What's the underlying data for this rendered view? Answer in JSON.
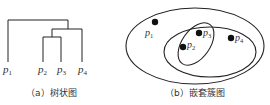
{
  "figure": {
    "panels": [
      {
        "id": "a",
        "type": "dendrogram",
        "caption": "（a）树状图",
        "leaves": [
          "p1",
          "p2",
          "p3",
          "p4"
        ],
        "merges": [
          {
            "clusters": [
              "p2",
              "p3"
            ],
            "order": 1
          },
          {
            "clusters": [
              "p2p3",
              "p4"
            ],
            "order": 2
          },
          {
            "clusters": [
              "p1",
              "p2p3p4"
            ],
            "order": 3
          }
        ]
      },
      {
        "id": "b",
        "type": "nested-cluster-diagram",
        "caption": "（b）嵌套簇图",
        "points": [
          "p1",
          "p2",
          "p3",
          "p4"
        ],
        "clusters": [
          {
            "level": "inner",
            "members": [
              "p2",
              "p3"
            ]
          },
          {
            "level": "middle",
            "members": [
              "p2",
              "p3",
              "p4"
            ]
          },
          {
            "level": "outer",
            "members": [
              "p1",
              "p2",
              "p3",
              "p4"
            ]
          }
        ]
      }
    ],
    "labels": {
      "p1": "p",
      "p1_sub": "1",
      "p2": "p",
      "p2_sub": "2",
      "p3": "p",
      "p3_sub": "3",
      "p4": "p",
      "p4_sub": "4"
    },
    "colors": {
      "line": "#222222",
      "point": "#111111",
      "text": "#333333"
    }
  }
}
